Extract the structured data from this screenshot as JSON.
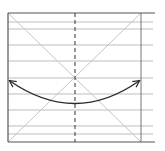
{
  "diagram": {
    "width": 165,
    "height": 151,
    "colors": {
      "background": "#ffffff",
      "frame": "#555555",
      "grid": "#bdbdbd",
      "diagonal": "#c6c6c6",
      "center_dash": "#333333",
      "curve": "#2b2b2b"
    },
    "frame": {
      "left": 8,
      "top": 13,
      "right_vertical": 141,
      "bottom": 142,
      "line_extent": 155
    },
    "horizontal_lines_y": [
      22,
      29,
      45,
      61,
      78,
      94,
      110,
      126,
      134
    ],
    "center_line_x": 75,
    "center_point": {
      "x": 75,
      "y": 78
    },
    "curve": {
      "start": {
        "x": 10,
        "y": 81
      },
      "control": {
        "x": 75,
        "y": 126
      },
      "end": {
        "x": 139,
        "y": 81
      },
      "arrowheads": [
        "start",
        "end"
      ],
      "icon": "double-headed-curved-arrow"
    }
  }
}
